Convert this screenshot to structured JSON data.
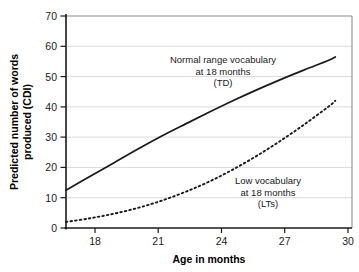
{
  "chart_data": {
    "type": "line",
    "title": "",
    "xlabel": "Age in months",
    "ylabel": "Predicted number of words produced (CDI)",
    "ylabel_line1": "Predicted number of words",
    "ylabel_line2": "produced (CDI)",
    "xlim": [
      18,
      30
    ],
    "ylim": [
      0,
      70
    ],
    "xticks": [
      18,
      21,
      24,
      27,
      30
    ],
    "yticks": [
      0,
      10,
      20,
      30,
      40,
      50,
      60,
      70
    ],
    "grid": "horizontal",
    "legend": "none (inline annotations)",
    "series": [
      {
        "name": "Normal range vocabulary at 18 months (TD)",
        "style": "solid",
        "color": "#1a1a1a",
        "x": [
          18,
          19,
          20,
          21,
          22,
          23,
          24,
          25,
          26,
          27,
          28,
          29,
          29.3
        ],
        "values": [
          12.5,
          17.0,
          21.5,
          26.0,
          30.3,
          34.3,
          38.2,
          42.0,
          45.6,
          49.0,
          52.2,
          55.3,
          56.5
        ]
      },
      {
        "name": "Low vocabulary at 18 months (LTs)",
        "style": "dotted",
        "color": "#1a1a1a",
        "x": [
          18,
          19,
          20,
          21,
          22,
          23,
          24,
          25,
          26,
          27,
          28,
          29,
          29.3
        ],
        "values": [
          2.0,
          3.2,
          4.7,
          6.6,
          9.0,
          11.9,
          15.3,
          19.3,
          23.8,
          28.8,
          34.2,
          40.0,
          42.0
        ]
      }
    ],
    "annotations": [
      {
        "id": "td-annotation",
        "lines": [
          "Normal range vocabulary",
          "at 18 months",
          "(TD)"
        ],
        "x": 23.0,
        "y": 54.0
      },
      {
        "id": "lts-annotation",
        "lines": [
          "Low vocabulary",
          "at 18 months",
          "(LTs)"
        ],
        "x": 26.0,
        "y": 17.5
      }
    ],
    "colors": {
      "axis": "#000000",
      "grid": "#d9d9d9",
      "curve": "#1a1a1a",
      "background": "#ffffff"
    }
  },
  "axis": {
    "x_title": "Age in months",
    "y_title_line1": "Predicted number of words",
    "y_title_line2": "produced (CDI)",
    "xticks": {
      "t0": "18",
      "t1": "21",
      "t2": "24",
      "t3": "27",
      "t4": "30"
    },
    "yticks": {
      "t0": "0",
      "t1": "10",
      "t2": "20",
      "t3": "30",
      "t4": "40",
      "t5": "50",
      "t6": "60",
      "t7": "70"
    }
  },
  "annotations": {
    "td": {
      "l1": "Normal range vocabulary",
      "l2": "at 18 months",
      "l3": "(TD)"
    },
    "lts": {
      "l1": "Low vocabulary",
      "l2": "at 18 months",
      "l3": "(LTs)"
    }
  }
}
